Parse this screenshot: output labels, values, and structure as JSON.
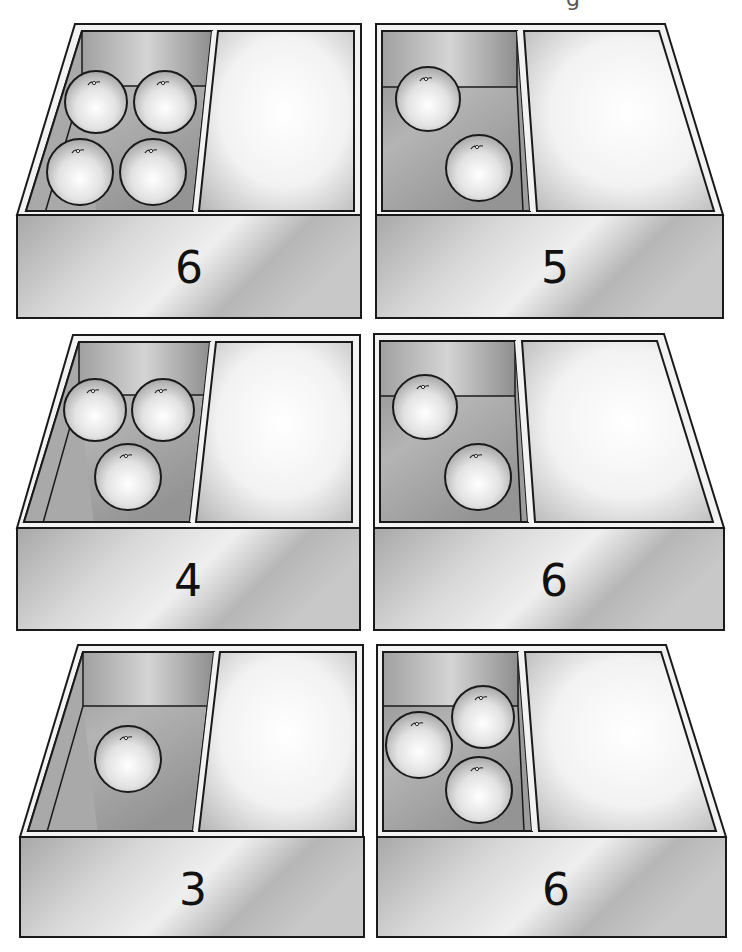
{
  "page": {
    "header_fragment": "g",
    "background": "#ffffff"
  },
  "colors": {
    "outline": "#1a1a1a",
    "rim": "#f2f2f2",
    "front_face_light": "#e6e6e6",
    "front_face_dark": "#a4a4a4",
    "back_wall_light": "#d4d4d4",
    "back_wall_dark": "#9a9a9a",
    "floor_light": "#c8c8c8",
    "floor_dark": "#8a8a8a",
    "empty_light": "#ffffff",
    "empty_dark": "#b8b8b8",
    "orange_light": "#ffffff",
    "orange_dark": "#a8a8a8"
  },
  "boxes": [
    {
      "id": "box-1",
      "number": "6",
      "orange_count": 4,
      "orientation": "slant-left",
      "outer_top": [
        [
          75,
          24
        ],
        [
          361,
          24
        ],
        [
          361,
          215
        ],
        [
          17,
          215
        ]
      ],
      "front": [
        17,
        215,
        344,
        103
      ],
      "filled": [
        [
          82,
          31
        ],
        [
          212,
          31
        ],
        [
          193,
          211
        ],
        [
          26,
          211
        ]
      ],
      "back_wall_y": 86,
      "divider_gap": [
        [
          212,
          31
        ],
        [
          218,
          31
        ],
        [
          199,
          211
        ],
        [
          193,
          211
        ]
      ],
      "empty": [
        [
          218,
          31
        ],
        [
          354,
          31
        ],
        [
          354,
          211
        ],
        [
          199,
          211
        ]
      ],
      "number_pos": [
        189,
        283
      ],
      "oranges": [
        [
          96,
          102,
          31
        ],
        [
          165,
          102,
          31
        ],
        [
          80,
          172,
          33
        ],
        [
          153,
          172,
          33
        ]
      ]
    },
    {
      "id": "box-2",
      "number": "5",
      "orange_count": 2,
      "orientation": "slant-right",
      "outer_top": [
        [
          376,
          24
        ],
        [
          665,
          24
        ],
        [
          723,
          215
        ],
        [
          376,
          215
        ]
      ],
      "front": [
        376,
        215,
        347,
        103
      ],
      "filled": [
        [
          382,
          31
        ],
        [
          517,
          31
        ],
        [
          530,
          211
        ],
        [
          382,
          211
        ]
      ],
      "back_wall_y": 87,
      "divider_gap": [
        [
          517,
          31
        ],
        [
          524,
          31
        ],
        [
          537,
          211
        ],
        [
          530,
          211
        ]
      ],
      "empty": [
        [
          524,
          31
        ],
        [
          659,
          31
        ],
        [
          714,
          211
        ],
        [
          537,
          211
        ]
      ],
      "number_pos": [
        555,
        283
      ],
      "oranges": [
        [
          428,
          99,
          32
        ],
        [
          479,
          168,
          33
        ]
      ]
    },
    {
      "id": "box-3",
      "number": "4",
      "orange_count": 3,
      "orientation": "slant-left",
      "outer_top": [
        [
          73,
          335
        ],
        [
          360,
          335
        ],
        [
          360,
          528
        ],
        [
          17,
          528
        ]
      ],
      "front": [
        17,
        528,
        343,
        102
      ],
      "filled": [
        [
          79,
          342
        ],
        [
          210,
          342
        ],
        [
          190,
          522
        ],
        [
          24,
          522
        ]
      ],
      "back_wall_y": 395,
      "divider_gap": [
        [
          210,
          342
        ],
        [
          216,
          342
        ],
        [
          196,
          522
        ],
        [
          190,
          522
        ]
      ],
      "empty": [
        [
          216,
          342
        ],
        [
          352,
          342
        ],
        [
          352,
          522
        ],
        [
          196,
          522
        ]
      ],
      "number_pos": [
        188,
        596
      ],
      "oranges": [
        [
          95,
          410,
          31
        ],
        [
          163,
          410,
          31
        ],
        [
          128,
          477,
          33
        ]
      ]
    },
    {
      "id": "box-4",
      "number": "6",
      "orange_count": 2,
      "orientation": "slant-right",
      "outer_top": [
        [
          374,
          334
        ],
        [
          664,
          334
        ],
        [
          724,
          528
        ],
        [
          374,
          528
        ]
      ],
      "front": [
        374,
        528,
        350,
        102
      ],
      "filled": [
        [
          380,
          341
        ],
        [
          515,
          341
        ],
        [
          528,
          522
        ],
        [
          380,
          522
        ]
      ],
      "back_wall_y": 396,
      "divider_gap": [
        [
          515,
          341
        ],
        [
          522,
          341
        ],
        [
          535,
          522
        ],
        [
          528,
          522
        ]
      ],
      "empty": [
        [
          522,
          341
        ],
        [
          657,
          341
        ],
        [
          713,
          522
        ],
        [
          535,
          522
        ]
      ],
      "number_pos": [
        554,
        596
      ],
      "oranges": [
        [
          425,
          407,
          32
        ],
        [
          478,
          477,
          33
        ]
      ]
    },
    {
      "id": "box-5",
      "number": "3",
      "orange_count": 1,
      "orientation": "slant-left",
      "outer_top": [
        [
          78,
          645
        ],
        [
          363,
          645
        ],
        [
          363,
          837
        ],
        [
          20,
          837
        ]
      ],
      "front": [
        20,
        837,
        344,
        100
      ],
      "filled": [
        [
          83,
          652
        ],
        [
          214,
          652
        ],
        [
          193,
          831
        ],
        [
          28,
          831
        ]
      ],
      "back_wall_y": 706,
      "divider_gap": [
        [
          214,
          652
        ],
        [
          220,
          652
        ],
        [
          199,
          831
        ],
        [
          193,
          831
        ]
      ],
      "empty": [
        [
          220,
          652
        ],
        [
          356,
          652
        ],
        [
          356,
          831
        ],
        [
          199,
          831
        ]
      ],
      "number_pos": [
        193,
        905
      ],
      "oranges": [
        [
          128,
          759,
          33
        ]
      ]
    },
    {
      "id": "box-6",
      "number": "6",
      "orange_count": 3,
      "orientation": "slant-right",
      "outer_top": [
        [
          377,
          645
        ],
        [
          666,
          645
        ],
        [
          726,
          837
        ],
        [
          377,
          837
        ]
      ],
      "front": [
        377,
        837,
        349,
        100
      ],
      "filled": [
        [
          383,
          652
        ],
        [
          518,
          652
        ],
        [
          532,
          831
        ],
        [
          383,
          831
        ]
      ],
      "back_wall_y": 706,
      "divider_gap": [
        [
          518,
          652
        ],
        [
          525,
          652
        ],
        [
          539,
          831
        ],
        [
          532,
          831
        ]
      ],
      "empty": [
        [
          525,
          652
        ],
        [
          661,
          652
        ],
        [
          716,
          831
        ],
        [
          539,
          831
        ]
      ],
      "number_pos": [
        556,
        905
      ],
      "oranges": [
        [
          419,
          745,
          33
        ],
        [
          483,
          717,
          31
        ],
        [
          479,
          790,
          33
        ]
      ]
    }
  ]
}
